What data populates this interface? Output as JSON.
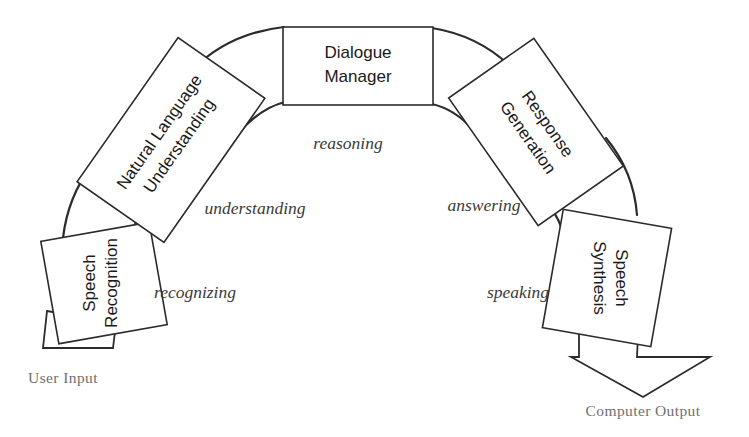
{
  "diagram": {
    "background_color": "#ffffff",
    "stroke_color": "#2b2b2b",
    "label_color": "#3a3a3a",
    "io_label_color": "#6f6f6f",
    "nodes": [
      {
        "id": "speech-recognition",
        "line1": "Speech",
        "line2": "Recognition",
        "rotation_deg": -10,
        "text_rotation_deg": -80
      },
      {
        "id": "natural-language-understanding",
        "line1": "Natural Language",
        "line2": "Understanding",
        "rotation_deg": -55,
        "text_rotation_deg": -55
      },
      {
        "id": "dialogue-manager",
        "line1": "Dialogue",
        "line2": "Manager",
        "rotation_deg": 0,
        "text_rotation_deg": 0
      },
      {
        "id": "response-generation",
        "line1": "Response",
        "line2": "Generation",
        "rotation_deg": 55,
        "text_rotation_deg": 55
      },
      {
        "id": "speech-synthesis",
        "line1": "Speech",
        "line2": "Synthesis",
        "rotation_deg": 10,
        "text_rotation_deg": 80
      }
    ],
    "edge_labels": [
      {
        "id": "recognizing",
        "text": "recognizing"
      },
      {
        "id": "understanding",
        "text": "understanding"
      },
      {
        "id": "reasoning",
        "text": "reasoning"
      },
      {
        "id": "answering",
        "text": "answering"
      },
      {
        "id": "speaking",
        "text": "speaking"
      }
    ],
    "io_labels": [
      {
        "id": "user-input",
        "text": "User Input"
      },
      {
        "id": "computer-output",
        "text": "Computer Output"
      }
    ]
  }
}
